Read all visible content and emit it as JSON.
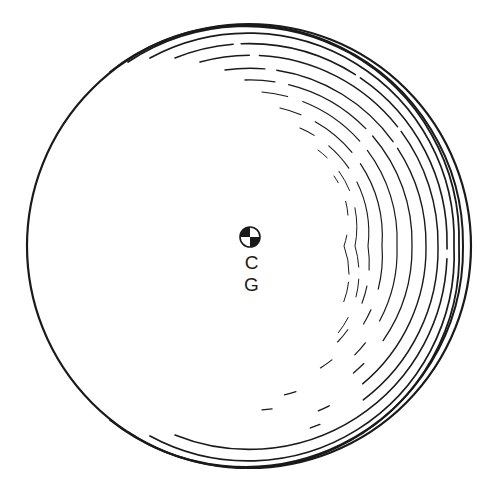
{
  "diagram": {
    "label": "C G",
    "colors": {
      "ink": "#1a1a1a",
      "background": "#ffffff"
    },
    "outer_circle": {
      "cx": 249,
      "cy": 246,
      "r": 222
    },
    "cg_symbol": {
      "cx": 250,
      "cy": 237,
      "r": 10
    }
  }
}
